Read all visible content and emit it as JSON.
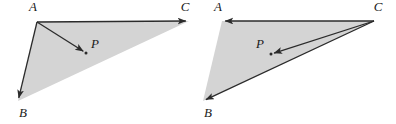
{
  "figure": {
    "name": "vector-triangle-pair",
    "canvas": {
      "width": 396,
      "height": 124
    },
    "background_color": "#ffffff",
    "fill_color": "#d4d4d4",
    "stroke_color": "#2b2b2b",
    "label_color": "#1a1a1a",
    "panels": [
      {
        "id": "left",
        "name": "left-panel",
        "origin_vertex": "A",
        "vertices": {
          "A": {
            "label": "A",
            "x": 37,
            "y": 22,
            "label_x": 33,
            "label_y": 11
          },
          "B": {
            "label": "B",
            "x": 18,
            "y": 101,
            "label_x": 23,
            "label_y": 117
          },
          "C": {
            "label": "C",
            "x": 189,
            "y": 21,
            "label_x": 185,
            "label_y": 11
          },
          "P": {
            "label": "P",
            "x": 86,
            "y": 53,
            "label_x": 95,
            "label_y": 48
          }
        },
        "vectors": [
          {
            "name": "vector-AB",
            "from": "A",
            "to": "B"
          },
          {
            "name": "vector-AC",
            "from": "A",
            "to": "C"
          },
          {
            "name": "vector-AP",
            "from": "A",
            "to": "P"
          }
        ]
      },
      {
        "id": "right",
        "name": "right-panel",
        "origin_vertex": "C",
        "vertices": {
          "A": {
            "label": "A",
            "x": 222,
            "y": 21,
            "label_x": 218,
            "label_y": 11
          },
          "B": {
            "label": "B",
            "x": 203,
            "y": 101,
            "label_x": 208,
            "label_y": 117
          },
          "C": {
            "label": "C",
            "x": 374,
            "y": 21,
            "label_x": 378,
            "label_y": 11
          },
          "P": {
            "label": "P",
            "x": 271,
            "y": 54,
            "label_x": 260,
            "label_y": 48
          }
        },
        "vectors": [
          {
            "name": "vector-CA",
            "from": "C",
            "to": "A"
          },
          {
            "name": "vector-CB",
            "from": "C",
            "to": "B"
          },
          {
            "name": "vector-CP",
            "from": "C",
            "to": "P"
          }
        ]
      }
    ]
  }
}
